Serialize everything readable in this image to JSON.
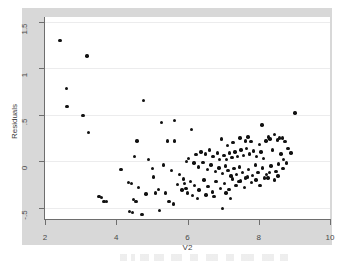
{
  "figure": {
    "background_color": "#ffffff",
    "panel_color": "#d8d8d8",
    "plot_background_color": "#ffffff",
    "grid_color": "#ececed",
    "axis_color": "#6e6e6e",
    "marker_color": "#111111"
  },
  "chart_data": {
    "type": "scatter",
    "title": "",
    "subtitle": "",
    "xlabel": "V2",
    "ylabel": "Residuals",
    "xlim": [
      2,
      10
    ],
    "ylim": [
      -0.62,
      1.55
    ],
    "grid": true,
    "grid_axis": "y",
    "legend": false,
    "legend_position": "none",
    "xticks": [
      2,
      4,
      6,
      8,
      10
    ],
    "xtick_labels": [
      "2",
      "4",
      "6",
      "8",
      "10"
    ],
    "yticks": [
      1.5,
      1,
      0.5,
      0,
      -0.5
    ],
    "ytick_labels": [
      "1.5",
      "1",
      ".5",
      "0",
      "-.5"
    ],
    "marker": "filled-circle",
    "marker_size": 3.4,
    "n_points": 152,
    "series": [
      {
        "name": "Residuals vs V2",
        "color": "#111111",
        "points": [
          [
            2.42,
            1.3
          ],
          [
            3.18,
            1.13
          ],
          [
            2.6,
            0.78
          ],
          [
            2.62,
            0.59
          ],
          [
            3.07,
            0.49
          ],
          [
            3.22,
            0.31
          ],
          [
            4.77,
            0.65
          ],
          [
            9.02,
            0.52
          ],
          [
            5.27,
            0.42
          ],
          [
            5.63,
            0.44
          ],
          [
            6.12,
            0.34
          ],
          [
            8.09,
            0.39
          ],
          [
            4.58,
            0.22
          ],
          [
            5.43,
            0.22
          ],
          [
            5.63,
            0.22
          ],
          [
            6.95,
            0.24
          ],
          [
            7.47,
            0.25
          ],
          [
            7.62,
            0.22
          ],
          [
            8.02,
            0.18
          ],
          [
            8.32,
            0.24
          ],
          [
            8.45,
            0.29
          ],
          [
            8.58,
            0.25
          ],
          [
            8.66,
            0.25
          ],
          [
            8.74,
            0.21
          ],
          [
            8.82,
            0.14
          ],
          [
            7.7,
            0.26
          ],
          [
            7.78,
            0.21
          ],
          [
            7.28,
            0.2
          ],
          [
            7.12,
            0.17
          ],
          [
            8.2,
            0.22
          ],
          [
            8.27,
            0.26
          ],
          [
            8.52,
            0.23
          ],
          [
            4.52,
            0.05
          ],
          [
            4.9,
            0.02
          ],
          [
            5.33,
            -0.04
          ],
          [
            5.97,
            0.0
          ],
          [
            6.03,
            0.03
          ],
          [
            6.24,
            0.07
          ],
          [
            6.38,
            0.1
          ],
          [
            6.5,
            0.08
          ],
          [
            6.62,
            0.12
          ],
          [
            6.72,
            0.05
          ],
          [
            6.84,
            0.09
          ],
          [
            6.9,
            0.02
          ],
          [
            7.02,
            0.06
          ],
          [
            7.1,
            0.02
          ],
          [
            7.18,
            0.09
          ],
          [
            7.25,
            0.04
          ],
          [
            7.33,
            0.1
          ],
          [
            7.4,
            0.05
          ],
          [
            7.5,
            0.12
          ],
          [
            7.58,
            0.06
          ],
          [
            7.66,
            0.14
          ],
          [
            7.74,
            0.08
          ],
          [
            7.86,
            0.11
          ],
          [
            7.94,
            0.05
          ],
          [
            8.06,
            0.1
          ],
          [
            8.14,
            0.03
          ],
          [
            8.38,
            0.12
          ],
          [
            8.62,
            0.08
          ],
          [
            8.7,
            0.02
          ],
          [
            8.9,
            0.09
          ],
          [
            6.18,
            -0.02
          ],
          [
            6.3,
            -0.06
          ],
          [
            6.44,
            -0.01
          ],
          [
            6.56,
            -0.09
          ],
          [
            6.66,
            -0.04
          ],
          [
            6.78,
            -0.11
          ],
          [
            6.88,
            -0.07
          ],
          [
            6.98,
            -0.13
          ],
          [
            7.06,
            -0.05
          ],
          [
            7.14,
            -0.1
          ],
          [
            7.22,
            -0.16
          ],
          [
            7.3,
            -0.08
          ],
          [
            7.38,
            -0.14
          ],
          [
            7.46,
            -0.06
          ],
          [
            7.54,
            -0.12
          ],
          [
            7.62,
            -0.18
          ],
          [
            7.72,
            -0.09
          ],
          [
            7.82,
            -0.15
          ],
          [
            7.9,
            -0.04
          ],
          [
            7.98,
            -0.12
          ],
          [
            8.1,
            -0.07
          ],
          [
            8.22,
            -0.14
          ],
          [
            8.34,
            -0.05
          ],
          [
            8.48,
            -0.11
          ],
          [
            8.56,
            -0.03
          ],
          [
            8.68,
            -0.08
          ],
          [
            8.78,
            -0.02
          ],
          [
            5.02,
            -0.08
          ],
          [
            5.55,
            -0.1
          ],
          [
            5.78,
            -0.14
          ],
          [
            5.88,
            -0.19
          ],
          [
            5.92,
            -0.24
          ],
          [
            5.96,
            -0.29
          ],
          [
            6.0,
            -0.34
          ],
          [
            6.08,
            -0.22
          ],
          [
            6.2,
            -0.26
          ],
          [
            6.32,
            -0.31
          ],
          [
            6.46,
            -0.2
          ],
          [
            6.58,
            -0.27
          ],
          [
            6.7,
            -0.33
          ],
          [
            6.8,
            -0.22
          ],
          [
            6.92,
            -0.29
          ],
          [
            7.04,
            -0.24
          ],
          [
            7.16,
            -0.3
          ],
          [
            7.26,
            -0.19
          ],
          [
            7.36,
            -0.26
          ],
          [
            7.48,
            -0.21
          ],
          [
            7.6,
            -0.28
          ],
          [
            7.68,
            -0.17
          ],
          [
            7.8,
            -0.23
          ],
          [
            7.92,
            -0.2
          ],
          [
            8.04,
            -0.26
          ],
          [
            8.16,
            -0.18
          ],
          [
            8.3,
            -0.12
          ],
          [
            8.44,
            -0.2
          ],
          [
            8.54,
            -0.16
          ],
          [
            4.13,
            -0.09
          ],
          [
            4.35,
            -0.23
          ],
          [
            4.42,
            -0.24
          ],
          [
            5.05,
            -0.17
          ],
          [
            4.62,
            -0.28
          ],
          [
            5.18,
            -0.3
          ],
          [
            5.38,
            -0.34
          ],
          [
            5.72,
            -0.25
          ],
          [
            5.84,
            -0.31
          ],
          [
            6.14,
            -0.37
          ],
          [
            6.28,
            -0.4
          ],
          [
            6.52,
            -0.36
          ],
          [
            6.74,
            -0.38
          ],
          [
            7.08,
            -0.34
          ],
          [
            7.2,
            -0.4
          ],
          [
            7.44,
            -0.22
          ],
          [
            8.26,
            -0.18
          ],
          [
            3.52,
            -0.38
          ],
          [
            3.58,
            -0.39
          ],
          [
            3.66,
            -0.43
          ],
          [
            3.73,
            -0.43
          ],
          [
            4.48,
            -0.41
          ],
          [
            4.55,
            -0.43
          ],
          [
            4.83,
            -0.35
          ],
          [
            5.1,
            -0.34
          ],
          [
            5.48,
            -0.43
          ],
          [
            5.6,
            -0.46
          ],
          [
            4.38,
            -0.54
          ],
          [
            4.45,
            -0.55
          ],
          [
            4.72,
            -0.57
          ],
          [
            5.22,
            -0.53
          ],
          [
            6.98,
            -0.51
          ]
        ]
      }
    ]
  },
  "axis": {
    "x_title": "V2",
    "y_title": "Residuals"
  }
}
